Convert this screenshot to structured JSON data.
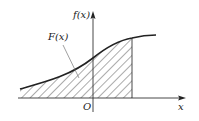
{
  "diagram": {
    "y_axis_label": "f(x)",
    "x_axis_label": "x",
    "origin_label": "O",
    "area_label": "F(x)",
    "colors": {
      "stroke": "#222222",
      "hatch": "#444444",
      "leader": "#777777",
      "background": "#ffffff"
    }
  }
}
